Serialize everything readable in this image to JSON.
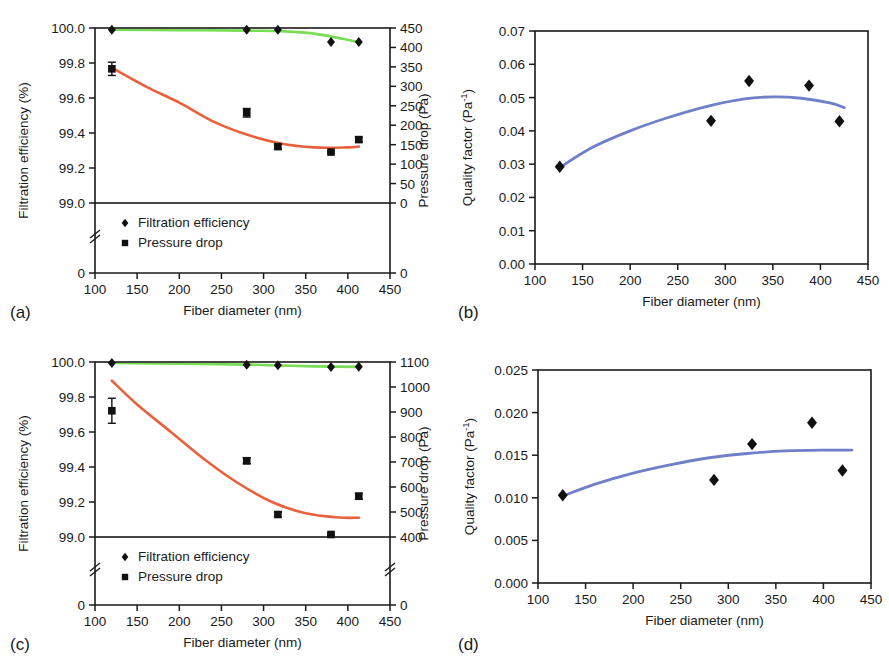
{
  "figure": {
    "panels": [
      "a",
      "b",
      "c",
      "d"
    ],
    "shared_xlabel": "Fiber diameter (nm)",
    "colors": {
      "efficiency_fit": "#77DD55",
      "pressure_fit": "#E8613C",
      "quality_fit": "#7080C8",
      "marker": "#111111",
      "axis": "#1a1a1a"
    }
  },
  "chart_data": [
    {
      "panel_label": "(a)",
      "type": "scatter",
      "title": "",
      "xlabel": "Fiber diameter (nm)",
      "ylabel": "Filtration efficiency (%)",
      "y2label": "Pressure drop (Pa)",
      "xlim": [
        100,
        450
      ],
      "xticks": [
        100,
        150,
        200,
        250,
        300,
        350,
        400,
        450
      ],
      "ylim": [
        99.0,
        100.0
      ],
      "yticks": [
        99.0,
        99.2,
        99.4,
        99.6,
        99.8,
        100.0
      ],
      "y_axis_break": true,
      "y_break_bottom_tick": "0",
      "y2lim": [
        0,
        450
      ],
      "y2ticks": [
        0,
        50,
        100,
        150,
        200,
        250,
        300,
        350,
        400,
        450
      ],
      "grid": false,
      "legend": [
        "Filtration efficiency",
        "Pressure drop"
      ],
      "legend_position": "lower-left-inside",
      "series": [
        {
          "name": "Filtration efficiency",
          "axis": "left",
          "marker": "diamond",
          "x": [
            120,
            280,
            317,
            380,
            413
          ],
          "values": [
            99.99,
            99.99,
            99.99,
            99.92,
            99.92
          ],
          "yerr": [
            0.0,
            0.0,
            0.0,
            0.0,
            0.0
          ]
        },
        {
          "name": "Pressure drop",
          "axis": "right",
          "marker": "square",
          "x": [
            120,
            280,
            317,
            380,
            413
          ],
          "values": [
            345,
            232,
            145,
            131,
            163
          ],
          "yerr": [
            17,
            11,
            6,
            3,
            6
          ]
        }
      ],
      "fits": [
        {
          "name": "efficiency trend",
          "color": "#77DD55",
          "axis": "left",
          "points": [
            [
              120,
              99.99
            ],
            [
              200,
              99.988
            ],
            [
              280,
              99.985
            ],
            [
              320,
              99.982
            ],
            [
              360,
              99.968
            ],
            [
              413,
              99.92
            ]
          ]
        },
        {
          "name": "pressure trend",
          "color": "#E8613C",
          "axis": "right",
          "points": [
            [
              120,
              348
            ],
            [
              160,
              300
            ],
            [
              200,
              258
            ],
            [
              240,
              210
            ],
            [
              280,
              176
            ],
            [
              320,
              153
            ],
            [
              360,
              143
            ],
            [
              400,
              143
            ],
            [
              413,
              145
            ]
          ]
        }
      ]
    },
    {
      "panel_label": "(b)",
      "type": "scatter",
      "title": "",
      "xlabel": "Fiber diameter (nm)",
      "ylabel": "Quality factor (Pa⁻¹)",
      "xlim": [
        100,
        450
      ],
      "xticks": [
        100,
        150,
        200,
        250,
        300,
        350,
        400,
        450
      ],
      "ylim": [
        0.0,
        0.07
      ],
      "yticks": [
        0.0,
        0.01,
        0.02,
        0.03,
        0.04,
        0.05,
        0.06,
        0.07
      ],
      "ytick_labels": [
        "0.00",
        "0.01",
        "0.02",
        "0.03",
        "0.04",
        "0.05",
        "0.06",
        "0.07"
      ],
      "grid": false,
      "series": [
        {
          "name": "Quality factor",
          "marker": "diamond",
          "x": [
            126,
            285,
            325,
            388,
            420
          ],
          "values": [
            0.0292,
            0.043,
            0.055,
            0.0536,
            0.0429
          ]
        }
      ],
      "fits": [
        {
          "name": "quality trend",
          "color": "#7080C8",
          "points": [
            [
              126,
              0.029
            ],
            [
              160,
              0.035
            ],
            [
              200,
              0.04
            ],
            [
              240,
              0.044
            ],
            [
              280,
              0.0473
            ],
            [
              320,
              0.0496
            ],
            [
              350,
              0.0502
            ],
            [
              380,
              0.0498
            ],
            [
              410,
              0.0484
            ],
            [
              425,
              0.047
            ]
          ]
        }
      ]
    },
    {
      "panel_label": "(c)",
      "type": "scatter",
      "title": "",
      "xlabel": "Fiber diameter (nm)",
      "ylabel": "Filtration efficiency (%)",
      "y2label": "Pressure drop (Pa)",
      "xlim": [
        100,
        450
      ],
      "xticks": [
        100,
        150,
        200,
        250,
        300,
        350,
        400,
        450
      ],
      "ylim": [
        99.0,
        100.0
      ],
      "yticks": [
        99.0,
        99.2,
        99.4,
        99.6,
        99.8,
        100.0
      ],
      "y_axis_break": true,
      "y_break_bottom_tick": "0",
      "y2lim": [
        400,
        1100
      ],
      "y2ticks": [
        400,
        500,
        600,
        700,
        800,
        900,
        1000,
        1100
      ],
      "y2_axis_break": true,
      "y2_break_bottom_tick": "0",
      "grid": false,
      "legend": [
        "Filtration efficiency",
        "Pressure drop"
      ],
      "legend_position": "lower-left-inside",
      "series": [
        {
          "name": "Filtration efficiency",
          "axis": "left",
          "marker": "diamond",
          "x": [
            120,
            280,
            317,
            380,
            413
          ],
          "values": [
            99.995,
            99.985,
            99.982,
            99.972,
            99.973
          ],
          "yerr": [
            0.0,
            0.0,
            0.0,
            0.0,
            0.0
          ]
        },
        {
          "name": "Pressure drop",
          "axis": "right",
          "marker": "square",
          "x": [
            120,
            280,
            317,
            380,
            413
          ],
          "values": [
            905,
            705,
            490,
            410,
            563
          ],
          "yerr": [
            50,
            12,
            10,
            4,
            12
          ]
        }
      ],
      "fits": [
        {
          "name": "efficiency trend",
          "color": "#77DD55",
          "axis": "left",
          "points": [
            [
              120,
              99.995
            ],
            [
              200,
              99.99
            ],
            [
              280,
              99.985
            ],
            [
              320,
              99.98
            ],
            [
              360,
              99.975
            ],
            [
              413,
              99.972
            ]
          ]
        },
        {
          "name": "pressure trend",
          "color": "#E8613C",
          "axis": "right",
          "points": [
            [
              120,
              1025
            ],
            [
              150,
              930
            ],
            [
              190,
              820
            ],
            [
              230,
              710
            ],
            [
              270,
              615
            ],
            [
              310,
              540
            ],
            [
              350,
              495
            ],
            [
              390,
              478
            ],
            [
              413,
              477
            ]
          ]
        }
      ]
    },
    {
      "panel_label": "(d)",
      "type": "scatter",
      "title": "",
      "xlabel": "Fiber diameter (nm)",
      "ylabel": "Quality factor (Pa⁻¹)",
      "xlim": [
        100,
        450
      ],
      "xticks": [
        100,
        150,
        200,
        250,
        300,
        350,
        400,
        450
      ],
      "ylim": [
        0.0,
        0.025
      ],
      "yticks": [
        0.0,
        0.005,
        0.01,
        0.015,
        0.02,
        0.025
      ],
      "ytick_labels": [
        "0.000",
        "0.005",
        "0.010",
        "0.015",
        "0.020",
        "0.025"
      ],
      "grid": false,
      "series": [
        {
          "name": "Quality factor",
          "marker": "diamond",
          "x": [
            126,
            285,
            325,
            388,
            420
          ],
          "values": [
            0.0103,
            0.0121,
            0.0163,
            0.0188,
            0.0132
          ]
        }
      ],
      "fits": [
        {
          "name": "quality trend",
          "color": "#7080C8",
          "points": [
            [
              126,
              0.0102
            ],
            [
              160,
              0.0116
            ],
            [
              200,
              0.0129
            ],
            [
              240,
              0.0139
            ],
            [
              280,
              0.0147
            ],
            [
              320,
              0.0152
            ],
            [
              360,
              0.0155
            ],
            [
              400,
              0.0156
            ],
            [
              430,
              0.0156
            ]
          ]
        }
      ]
    }
  ]
}
